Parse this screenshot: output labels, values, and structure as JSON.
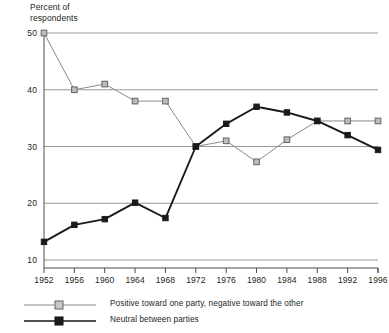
{
  "chart_data": {
    "type": "line",
    "title": "",
    "ylabel": "Percent of\nrespondents",
    "xlabel": "",
    "ylim": [
      10,
      50
    ],
    "yticks": [
      10,
      20,
      30,
      40,
      50
    ],
    "grid": "horizontal",
    "legend_position": "bottom-left",
    "categories": [
      1952,
      1956,
      1960,
      1964,
      1968,
      1972,
      1976,
      1980,
      1984,
      1988,
      1992,
      1996
    ],
    "xtick_labels": [
      "1952",
      "1956",
      "1960",
      "1964",
      "1968",
      "1972",
      "1976",
      "1980",
      "1984",
      "1988",
      "1992",
      "1996"
    ],
    "series": [
      {
        "name": "Positive toward one party, negative toward the other",
        "marker": "open-square",
        "color": "#8a8a8a",
        "values": [
          50.0,
          40.0,
          41.0,
          38.0,
          38.0,
          30.0,
          31.0,
          27.3,
          31.2,
          34.5,
          34.5,
          34.5
        ]
      },
      {
        "name": "Neutral between parties",
        "marker": "filled-square",
        "color": "#1a1a1a",
        "values": [
          13.2,
          16.2,
          17.2,
          20.1,
          17.4,
          30.0,
          34.0,
          37.0,
          36.0,
          34.5,
          32.0,
          29.4
        ]
      }
    ]
  },
  "axis": {
    "y_title_line1": "Percent of",
    "y_title_line2": "respondents"
  }
}
